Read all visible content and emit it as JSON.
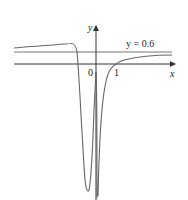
{
  "diagram": {
    "type": "function-graph",
    "axes": {
      "x_label": "x",
      "y_label": "y",
      "origin_label": "0",
      "x_tick_labels": [
        "1"
      ]
    },
    "asymptote": {
      "label": "y = 0.6",
      "value": 0.6
    },
    "colors": {
      "axis": "#333333",
      "curve": "#666666",
      "asymptote": "#777777"
    }
  }
}
